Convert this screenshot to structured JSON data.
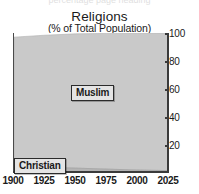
{
  "ghost_text": "percentage page heading",
  "chart_data": {
    "type": "area",
    "stacked": true,
    "title": "Religions",
    "subtitle": "(% of Total Population)",
    "xlabel": "",
    "ylabel": "",
    "xlim": [
      1900,
      2025
    ],
    "ylim": [
      0,
      100
    ],
    "grid": false,
    "legend": "none",
    "y_axis_side": "right",
    "xticks": [
      1900,
      1925,
      1950,
      1975,
      2000,
      2025
    ],
    "yticks": [
      20,
      40,
      60,
      80,
      100
    ],
    "x": [
      1900,
      1925,
      1950,
      1975,
      2000,
      2025
    ],
    "series": [
      {
        "name": "Christian",
        "color": "#b4b4b4",
        "values": [
          4,
          3.4,
          2.8,
          2.1,
          1.4,
          1.0
        ]
      },
      {
        "name": "Muslim",
        "color": "#c9c9c9",
        "values": [
          93,
          95,
          96.6,
          97.6,
          98.4,
          99.0
        ]
      }
    ],
    "annotations": [
      {
        "text": "Muslim",
        "series": "Muslim"
      },
      {
        "text": "Christian",
        "series": "Christian"
      }
    ]
  }
}
